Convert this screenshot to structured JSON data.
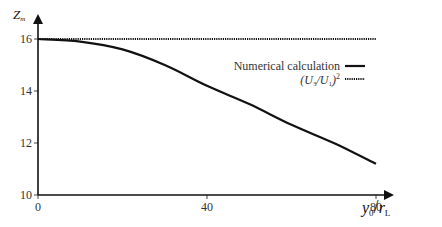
{
  "chart_data": {
    "type": "line",
    "title": "",
    "xlabel": "y0/rL",
    "ylabel": "Zm",
    "xlabel_parts": {
      "main": "y",
      "sub": "0",
      "sep": "/",
      "main2": "r",
      "sub2": "L"
    },
    "ylabel_parts": {
      "main": "Z",
      "sub": "m"
    },
    "xlim": [
      0,
      80
    ],
    "ylim": [
      10,
      16
    ],
    "x_ticks": [
      0,
      40,
      80
    ],
    "y_ticks": [
      10,
      12,
      14,
      16
    ],
    "x_tick_labels": [
      "0",
      "40",
      "80"
    ],
    "y_tick_labels": [
      "10",
      "12",
      "14",
      "16"
    ],
    "grid": false,
    "legend_position": "upper right",
    "series": [
      {
        "name": "Numerical calculation",
        "style": "solid",
        "color": "#111111",
        "x": [
          0,
          10,
          20,
          30,
          40,
          50,
          60,
          70,
          80
        ],
        "values": [
          16.0,
          15.9,
          15.6,
          15.0,
          14.2,
          13.5,
          12.7,
          12.0,
          11.2
        ]
      },
      {
        "name": "(U3/U1)^2",
        "style": "dotted",
        "color": "#111111",
        "x": [
          0,
          80
        ],
        "values": [
          16.0,
          16.0
        ]
      }
    ]
  },
  "legend": {
    "items": [
      {
        "label": "Numerical calculation",
        "style": "solid"
      },
      {
        "label_parts": {
          "open": "(U",
          "sub1": "3",
          "mid": "/U",
          "sub2": "1",
          "close": ")",
          "sup": "2"
        },
        "style": "dotted"
      }
    ]
  }
}
